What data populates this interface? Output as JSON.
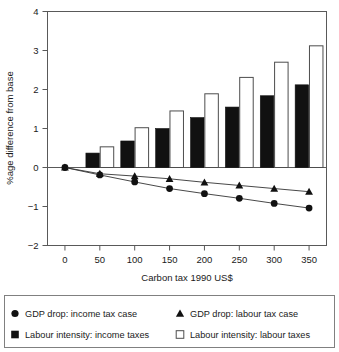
{
  "chart_data": {
    "type": "bar",
    "title": "",
    "subtitle": "",
    "xlabel": "Carbon tax 1990 US$",
    "ylabel": "%age difference from base",
    "categories": [
      "0",
      "50",
      "100",
      "150",
      "200",
      "250",
      "300",
      "350"
    ],
    "x": [
      0,
      50,
      100,
      150,
      200,
      250,
      300,
      350
    ],
    "xlim": [
      -25,
      375
    ],
    "ylim": [
      -2,
      4
    ],
    "yticks": [
      -2,
      -1,
      0,
      1,
      2,
      3,
      4
    ],
    "ytick_labels": [
      "−2",
      "−1",
      "0",
      "1",
      "2",
      "3",
      "4"
    ],
    "grid": false,
    "legend_position": "bottom-outside",
    "zero_line": 0,
    "series": [
      {
        "name": "Labour intensity: income taxes",
        "kind": "bar",
        "style": "filled-black",
        "color": "#111111",
        "values": [
          0,
          0.37,
          0.68,
          1.0,
          1.28,
          1.55,
          1.84,
          2.12
        ]
      },
      {
        "name": "Labour intensity: labour taxes",
        "kind": "bar",
        "style": "open-white",
        "color": "#ffffff",
        "values": [
          0,
          0.53,
          1.02,
          1.45,
          1.89,
          2.31,
          2.7,
          3.12
        ]
      },
      {
        "name": "GDP drop: income tax case",
        "kind": "line",
        "marker": "circle",
        "color": "#111111",
        "values": [
          0,
          -0.19,
          -0.37,
          -0.54,
          -0.67,
          -0.79,
          -0.92,
          -1.04
        ]
      },
      {
        "name": "GDP drop: labour tax case",
        "kind": "line",
        "marker": "triangle",
        "color": "#111111",
        "values": [
          0,
          -0.16,
          -0.22,
          -0.29,
          -0.38,
          -0.46,
          -0.54,
          -0.62
        ]
      }
    ]
  },
  "axes": {
    "x_title": "Carbon tax 1990 US$",
    "y_title": "%age difference from base",
    "x_tick_labels": [
      "0",
      "50",
      "100",
      "150",
      "200",
      "250",
      "300",
      "350"
    ],
    "y_tick_labels": [
      "4",
      "3",
      "2",
      "1",
      "0",
      "−1",
      "−2"
    ]
  },
  "legend": {
    "entries": [
      {
        "marker": "circle-filled",
        "label": "GDP drop: income tax case"
      },
      {
        "marker": "triangle-filled",
        "label": "GDP drop: labour tax case"
      },
      {
        "marker": "square-filled",
        "label": "Labour intensity: income taxes"
      },
      {
        "marker": "square-open",
        "label": "Labour intensity: labour taxes"
      }
    ]
  },
  "colors": {
    "axis": "#595959",
    "dark_series": "#111111",
    "light_series_fill": "#ffffff",
    "light_series_stroke": "#4d4d4d",
    "legend_border": "#808080"
  }
}
